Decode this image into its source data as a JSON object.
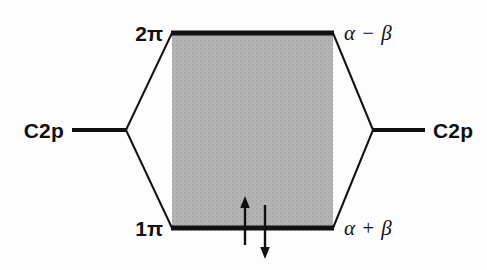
{
  "figure": {
    "type": "molecular-orbital-energy-level-diagram",
    "title": "",
    "background_color": "#fdfdfd",
    "line_color": "#111111",
    "fill_color": "#b0b0b0"
  },
  "levels": {
    "antibonding": {
      "orbital_label": "2π",
      "orbital_prefix": "2",
      "orbital_symbol": "π",
      "energy_label": "α − β",
      "y": 33
    },
    "bonding": {
      "orbital_label": "1π",
      "orbital_prefix": "1",
      "orbital_symbol": "π",
      "energy_label": "α + β",
      "y": 228
    },
    "atomic_left": {
      "label": "C2p",
      "y": 130
    },
    "atomic_right": {
      "label": "C2p",
      "y": 130
    }
  },
  "electrons": [
    {
      "name": "spin-up",
      "glyph": "↑",
      "x": 245,
      "from_y": 245,
      "to_y": 200
    },
    {
      "name": "spin-down",
      "glyph": "↓",
      "x": 265,
      "from_y": 205,
      "to_y": 258
    }
  ],
  "geometry": {
    "left_vertex_x": 126,
    "right_vertex_x": 373,
    "vertex_y": 130,
    "box_left_x": 172,
    "box_right_x": 333,
    "box_top_y": 33,
    "box_bottom_y": 228,
    "atomic_line_left_start_x": 72,
    "atomic_line_right_end_x": 425
  }
}
